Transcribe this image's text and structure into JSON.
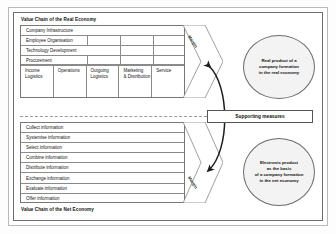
{
  "diagram": {
    "top_chain_title": "Value Chain of the Real Economy",
    "bottom_chain_title": "Value Chain of the Net Economy",
    "support_activities": [
      "Company Infrastructure",
      "Employee Organisation",
      "Technology Development",
      "Procurement"
    ],
    "primary_activities": [
      "Income\nLogistics",
      "Operations",
      "Outgoing\nLogistics",
      "Marketing\n& Distribution",
      "Service"
    ],
    "net_activities": [
      "Collect information",
      "Systemise information",
      "Select information",
      "Combine information",
      "Distribute information",
      "Exchange information",
      "Evaluate information",
      "Offer information"
    ],
    "margin_label_top": "Margin",
    "margin_label_bottom": "Margin",
    "supporting_measures": "Supporting measures",
    "outcome_top": "Real product of a\ncompany  formation\nin the real economy",
    "outcome_bottom": "Electronic product\nas the basis\nof a company formation\nin the net economy",
    "colors": {
      "frame_outer": "#b9b9b9",
      "frame_inner": "#6d6d6d",
      "cell_border": "#8a8a8a",
      "ellipse_fill": "#f3f3f3",
      "arrow": "#1c1c1c"
    }
  }
}
